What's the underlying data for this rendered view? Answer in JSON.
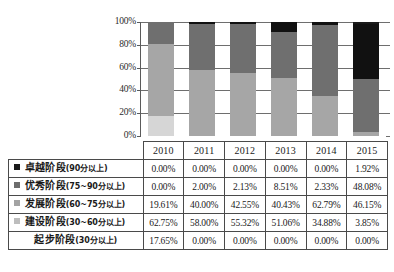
{
  "chart_data": {
    "type": "bar",
    "subtype": "stacked-100-percent",
    "title": "",
    "xlabel": "",
    "ylabel": "",
    "ylim": [
      0,
      100
    ],
    "ytick_labels": [
      "100%",
      "80%",
      "60%",
      "40%",
      "20%",
      "0%"
    ],
    "ytick_values": [
      100,
      80,
      60,
      40,
      20,
      0
    ],
    "grid": true,
    "legend_position": "table-row-labels",
    "categories": [
      "2010",
      "2011",
      "2012",
      "2013",
      "2014",
      "2015"
    ],
    "stack_order_bottom_to_top": [
      "起步阶段(30分以上)",
      "建设阶段(30~60分以上)",
      "发展阶段(60~75分以上)",
      "优秀阶段(75~90分以上)",
      "卓越阶段(90分以上)"
    ],
    "series": [
      {
        "name": "卓越阶段(90分以上)",
        "name_main": "卓越阶段",
        "name_range": "(90分以上)",
        "color": "#1a1a1a",
        "marker": "filled-square",
        "values": [
          0.0,
          0.0,
          0.0,
          0.0,
          0.0,
          1.92
        ],
        "values_text": [
          "0.00%",
          "0.00%",
          "0.00%",
          "0.00%",
          "0.00%",
          "1.92%"
        ]
      },
      {
        "name": "优秀阶段(75~90分以上)",
        "name_main": "优秀阶段",
        "name_range": "(75~90分以上)",
        "color": "#6d6d6d",
        "bar_color": "#111111",
        "marker": "filled-square",
        "values": [
          0.0,
          2.0,
          2.13,
          8.51,
          2.33,
          48.08
        ],
        "values_text": [
          "0.00%",
          "2.00%",
          "2.13%",
          "8.51%",
          "2.33%",
          "48.08%"
        ]
      },
      {
        "name": "发展阶段(60~75分以上)",
        "name_main": "发展阶段",
        "name_range": "(60~75分以上)",
        "color": "#909090",
        "bar_color": "#6f6f6f",
        "marker": "filled-square",
        "values": [
          19.61,
          40.0,
          42.55,
          40.43,
          62.79,
          46.15
        ],
        "values_text": [
          "19.61%",
          "40.00%",
          "42.55%",
          "40.43%",
          "62.79%",
          "46.15%"
        ]
      },
      {
        "name": "建设阶段(30~60分以上)",
        "name_main": "建设阶段",
        "name_range": "(30~60分以上)",
        "color": "#b4b4b4",
        "bar_color": "#a6a6a6",
        "marker": "filled-square",
        "values": [
          62.75,
          58.0,
          55.32,
          51.06,
          34.88,
          3.85
        ],
        "values_text": [
          "62.75%",
          "58.00%",
          "55.32%",
          "51.06%",
          "34.88%",
          "3.85%"
        ]
      },
      {
        "name": "起步阶段(30分以上)",
        "name_main": "起步阶段",
        "name_range": "(30分以上)",
        "color": "#d8d8d8",
        "bar_color": "#d6d6d6",
        "marker": "none",
        "values": [
          17.65,
          0.0,
          0.0,
          0.0,
          0.0,
          0.0
        ],
        "values_text": [
          "17.65%",
          "0.00%",
          "0.00%",
          "0.00%",
          "0.00%",
          "0.00%"
        ]
      }
    ]
  },
  "table": {
    "corner_label": "",
    "column_headers": [
      "2010",
      "2011",
      "2012",
      "2013",
      "2014",
      "2015"
    ],
    "rows": [
      {
        "label_main": "卓越阶段",
        "label_range": "(90分以上)",
        "marker_color": "#1a1a1a",
        "has_marker": true,
        "values": [
          "0.00%",
          "0.00%",
          "0.00%",
          "0.00%",
          "0.00%",
          "1.92%"
        ]
      },
      {
        "label_main": "优秀阶段",
        "label_range": "(75~90分以上)",
        "marker_color": "#6d6d6d",
        "has_marker": true,
        "values": [
          "0.00%",
          "2.00%",
          "2.13%",
          "8.51%",
          "2.33%",
          "48.08%"
        ]
      },
      {
        "label_main": "发展阶段",
        "label_range": "(60~75分以上)",
        "marker_color": "#a3a3a3",
        "has_marker": true,
        "values": [
          "19.61%",
          "40.00%",
          "42.55%",
          "40.43%",
          "62.79%",
          "46.15%"
        ]
      },
      {
        "label_main": "建设阶段",
        "label_range": "(30~60分以上)",
        "marker_color": "#bdbdbd",
        "has_marker": true,
        "values": [
          "62.75%",
          "58.00%",
          "55.32%",
          "51.06%",
          "34.88%",
          "3.85%"
        ]
      },
      {
        "label_main": "起步阶段",
        "label_range": "(30分以上)",
        "marker_color": "transparent",
        "has_marker": false,
        "values": [
          "17.65%",
          "0.00%",
          "0.00%",
          "0.00%",
          "0.00%",
          "0.00%"
        ]
      }
    ]
  },
  "colors": {
    "axis": "#5a5a5a",
    "grid": "#6e6e6e",
    "table_border": "#4a4a4a",
    "background": "#ffffff",
    "text": "#1a1a1a"
  }
}
